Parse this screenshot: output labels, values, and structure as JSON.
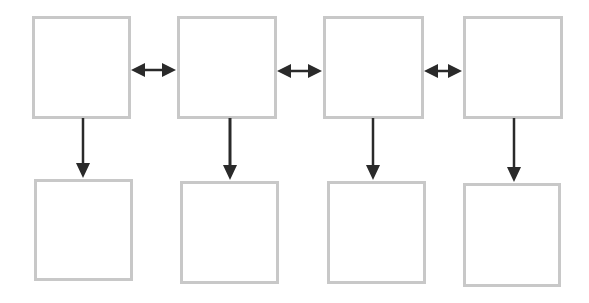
{
  "diagram": {
    "type": "flow-grid",
    "colors": {
      "box_border": "#c8c8c8",
      "arrow": "#2a2a2a",
      "background": "#ffffff"
    },
    "top_row": [
      {
        "id": "top-1",
        "label": ""
      },
      {
        "id": "top-2",
        "label": ""
      },
      {
        "id": "top-3",
        "label": ""
      },
      {
        "id": "top-4",
        "label": ""
      }
    ],
    "bottom_row": [
      {
        "id": "bottom-1",
        "label": ""
      },
      {
        "id": "bottom-2",
        "label": ""
      },
      {
        "id": "bottom-3",
        "label": ""
      },
      {
        "id": "bottom-4",
        "label": ""
      }
    ],
    "edges": [
      {
        "from": "top-1",
        "to": "top-2",
        "style": "bidirectional"
      },
      {
        "from": "top-2",
        "to": "top-3",
        "style": "bidirectional"
      },
      {
        "from": "top-3",
        "to": "top-4",
        "style": "bidirectional"
      },
      {
        "from": "top-1",
        "to": "bottom-1",
        "style": "directed"
      },
      {
        "from": "top-2",
        "to": "bottom-2",
        "style": "directed"
      },
      {
        "from": "top-3",
        "to": "bottom-3",
        "style": "directed"
      },
      {
        "from": "top-4",
        "to": "bottom-4",
        "style": "directed"
      }
    ]
  }
}
